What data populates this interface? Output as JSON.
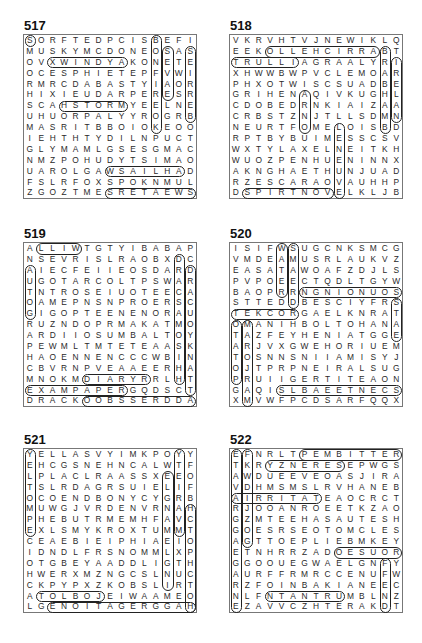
{
  "puzzles": [
    {
      "number": "517",
      "rows": [
        "SORFTEDPCISBEFI",
        "MUSKYMCDONEOSAS",
        "OVXWINDYAKONETE",
        "OCESPHIETEPFVWI",
        "RMRCDABASTYIAOR",
        "HIXIEUDARPERESR",
        "SCAHSTORMYEELNE",
        "UHUORPALYYROGRB",
        "MASRITBBOIOKEOO",
        "IEHTHTYDILNPUCT",
        "GLYMAMLGSESGMAC",
        "NMZPOHUDYTSIMAO",
        "UAROLGAWSAILHAD",
        "FSLRFOXSPOKNMUL",
        "ZGOZTMESRETAEWS"
      ],
      "highlights": [
        {
          "r": 3,
          "c": 3,
          "len": 7,
          "dir": "h"
        },
        {
          "r": 7,
          "c": 4,
          "len": 6,
          "dir": "h"
        },
        {
          "r": 13,
          "c": 8,
          "len": 7,
          "dir": "h"
        },
        {
          "r": 15,
          "c": 8,
          "len": 8,
          "dir": "h"
        },
        {
          "r": 1,
          "c": 12,
          "len": 9,
          "dir": "v"
        },
        {
          "r": 2,
          "c": 13,
          "len": 5,
          "dir": "v"
        },
        {
          "r": 2,
          "c": 15,
          "len": 7,
          "dir": "v"
        },
        {
          "r": 1,
          "c": 1,
          "len": 1,
          "dir": "h"
        }
      ]
    },
    {
      "number": "518",
      "rows": [
        "VKRVHTVJNEWIKLQ",
        "EEKOLLEHCIRRABT",
        "TRULLIAGRAALYRI",
        "XHWWBWPVCLEMOAR",
        "PHXOTWISCSUADBE",
        "GRIHENAQIVKUGHL",
        "CDOBEDRNKIAIZAA",
        "CRBSTZNJTLLSDMN",
        "NEURTFOMELOISBD",
        "RPTBYBUIMESSCSV",
        "WXTYLAXELNEITKH",
        "WUOZPENHUENINNX",
        "AKNGHAETHUNJUAD",
        "RZESCARAOVAUHHP",
        "DSPIRTNOVELKLJB"
      ],
      "highlights": [
        {
          "r": 2,
          "c": 4,
          "len": 10,
          "dir": "h"
        },
        {
          "r": 3,
          "c": 1,
          "len": 6,
          "dir": "h"
        },
        {
          "r": 15,
          "c": 2,
          "len": 8,
          "dir": "h"
        },
        {
          "r": 9,
          "c": 10,
          "len": 7,
          "dir": "v"
        },
        {
          "r": 3,
          "c": 15,
          "len": 6,
          "dir": "v"
        },
        {
          "r": 2,
          "c": 14,
          "len": 8,
          "dir": "v"
        },
        {
          "r": 6,
          "c": 7,
          "len": 4,
          "dir": "v"
        }
      ]
    },
    {
      "number": "519",
      "rows": [
        "ALLIWTGTYIBABAP",
        "NSEVRISLRAOBXDC",
        "AIECFEIIEOSDARD",
        "UGOTARCOLTPSWAR",
        "TNTROSEIUOTEECA",
        "OAMEPNSNPROERSC",
        "GIGOPTEENENORAU",
        "RUZNDOPRMAKATMO",
        "ARDIIOSUMBALTOY",
        "PEWMLTMTETEAASK",
        "HAOENNENCCCWBIN",
        "CBVRNPVEAAEERHA",
        "MNOKMDIARYRRLHT",
        "EXAMPAPERGQDSCT",
        "DRACKOOBSSERDDA"
      ],
      "highlights": [
        {
          "r": 1,
          "c": 2,
          "len": 4,
          "dir": "h"
        },
        {
          "r": 13,
          "c": 6,
          "len": 6,
          "dir": "h"
        },
        {
          "r": 14,
          "c": 1,
          "len": 9,
          "dir": "h"
        },
        {
          "r": 15,
          "c": 6,
          "len": 10,
          "dir": "h"
        },
        {
          "r": 2,
          "c": 14,
          "len": 12,
          "dir": "v"
        },
        {
          "r": 3,
          "c": 15,
          "len": 12,
          "dir": "v"
        },
        {
          "r": 3,
          "c": 1,
          "len": 5,
          "dir": "v"
        }
      ]
    },
    {
      "number": "520",
      "rows": [
        "ISIFWSUGCNKSMCG",
        "VMDEAMUSRLAUKVZ",
        "EASATAWOAFZDJLS",
        "PVPOEECTQDLTGYW",
        "BAOPRRNGNIONUOS",
        "STTEDDBESCIYFRS",
        "TEKCORGAELKNRAT",
        "OMANIHBOLTOHANA",
        "TAZFEYHENIATGGE",
        "ARJVXGWEHORIUEM",
        "TOSNNSNIIAMISYJ",
        "OJTPRPNEIRALSUG",
        "PRUIIGERTITEAON",
        "GAQISLBAEETNECS",
        "XMVWFPCDSARFQQX"
      ],
      "highlights": [
        {
          "r": 5,
          "c": 7,
          "len": 9,
          "dir": "h"
        },
        {
          "r": 7,
          "c": 1,
          "len": 6,
          "dir": "h"
        },
        {
          "r": 14,
          "c": 5,
          "len": 11,
          "dir": "h"
        },
        {
          "r": 1,
          "c": 5,
          "len": 5,
          "dir": "v"
        },
        {
          "r": 1,
          "c": 6,
          "len": 6,
          "dir": "v"
        },
        {
          "r": 8,
          "c": 1,
          "len": 6,
          "dir": "v"
        },
        {
          "r": 8,
          "c": 2,
          "len": 8,
          "dir": "v"
        },
        {
          "r": 6,
          "c": 15,
          "len": 4,
          "dir": "v"
        }
      ]
    },
    {
      "number": "521",
      "rows": [
        "YELLASVYIMKPOYY",
        "EHCGSNEHNCALWTF",
        "LPLACLRAASSXEEO",
        "TSLRDAGRSUIELIF",
        "OCOENDBONYCYGRB",
        "MUWGJVRDENVRNAH",
        "PHEBUTRMEMHFAVC",
        "EXLSMYKROXTUMMT",
        "CEAEBIEIPHIAEIO",
        "IDNDLFRSNOMMLXP",
        "OTGBEYAADDLIGTH",
        "HWERXMZNGCSLNUC",
        "CKPYPXZKOBSLIRT",
        "ATOLBOJEIWAAMEO",
        "LGENOITAGERGGAH"
      ],
      "highlights": [
        {
          "r": 14,
          "c": 2,
          "len": 6,
          "dir": "h"
        },
        {
          "r": 15,
          "c": 3,
          "len": 13,
          "dir": "h"
        },
        {
          "r": 1,
          "c": 1,
          "len": 8,
          "dir": "v"
        },
        {
          "r": 1,
          "c": 14,
          "len": 8,
          "dir": "v"
        },
        {
          "r": 3,
          "c": 13,
          "len": 11,
          "dir": "v"
        },
        {
          "r": 6,
          "c": 15,
          "len": 10,
          "dir": "v"
        }
      ]
    },
    {
      "number": "522",
      "rows": [
        "EFNRLTPEMBITTER",
        "TKRYZNERESEPWGS",
        "AWDUEEVEOASJIRA",
        "VDHMSMSLRVHANEB",
        "AIRRITATEAOCRCT",
        "RJOOANROEETKZAO",
        "GZMTEEHASAUTESH",
        "GOESRSEOTOMCLES",
        "AGTTOEPLIEBMKEY",
        "ETNHRRZADOESUOR",
        "GGOOUEGWAELGNFY",
        "AURFFRMRCCENUFW",
        "RZFOINBAKIANEEC",
        "NLFNTANTRUMBLNZ",
        "EZAVVCZHTERAKDT"
      ],
      "highlights": [
        {
          "r": 1,
          "c": 7,
          "len": 9,
          "dir": "h"
        },
        {
          "r": 2,
          "c": 4,
          "len": 7,
          "dir": "h"
        },
        {
          "r": 5,
          "c": 1,
          "len": 8,
          "dir": "h"
        },
        {
          "r": 10,
          "c": 10,
          "len": 6,
          "dir": "h"
        },
        {
          "r": 14,
          "c": 4,
          "len": 7,
          "dir": "h"
        },
        {
          "r": 1,
          "c": 1,
          "len": 15,
          "dir": "v"
        },
        {
          "r": 1,
          "c": 2,
          "len": 9,
          "dir": "v"
        },
        {
          "r": 11,
          "c": 14,
          "len": 5,
          "dir": "v"
        }
      ]
    }
  ],
  "positions": [
    {
      "left": 23,
      "top": 19
    },
    {
      "left": 229,
      "top": 19
    },
    {
      "left": 23,
      "top": 227
    },
    {
      "left": 229,
      "top": 227
    },
    {
      "left": 23,
      "top": 433
    },
    {
      "left": 229,
      "top": 433
    }
  ]
}
